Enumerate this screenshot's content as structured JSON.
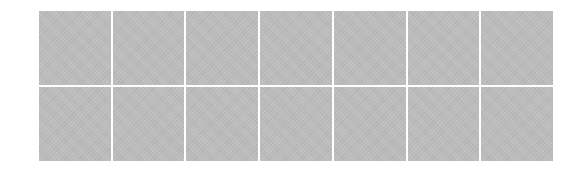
{
  "grid": {
    "rows": 2,
    "columns": 7,
    "tile_color": "#bdbdbd",
    "gap_color": "#ffffff",
    "tiles": [
      {
        "row": 1,
        "col": 1
      },
      {
        "row": 1,
        "col": 2
      },
      {
        "row": 1,
        "col": 3
      },
      {
        "row": 1,
        "col": 4
      },
      {
        "row": 1,
        "col": 5
      },
      {
        "row": 1,
        "col": 6
      },
      {
        "row": 1,
        "col": 7
      },
      {
        "row": 2,
        "col": 1
      },
      {
        "row": 2,
        "col": 2
      },
      {
        "row": 2,
        "col": 3
      },
      {
        "row": 2,
        "col": 4
      },
      {
        "row": 2,
        "col": 5
      },
      {
        "row": 2,
        "col": 6
      },
      {
        "row": 2,
        "col": 7
      }
    ]
  }
}
